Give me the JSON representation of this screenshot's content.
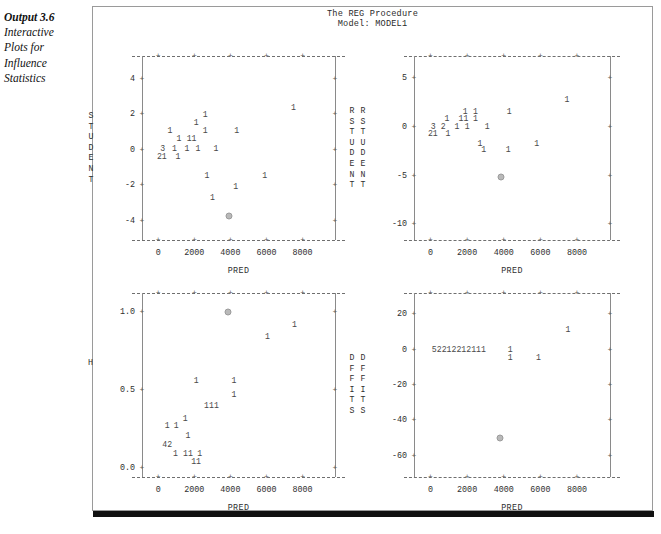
{
  "margin_caption": {
    "lead": "Output 3.6",
    "lines": [
      "Interactive",
      "Plots for",
      "Influence",
      "Statistics"
    ]
  },
  "report": {
    "title_line1": "The REG Procedure",
    "title_line2": "Model: MODEL1"
  },
  "axis": {
    "x_label": "PRED",
    "x_ticks": [
      "0",
      "2000",
      "4000",
      "6000",
      "8000"
    ],
    "x_tick_values": [
      0,
      2000,
      4000,
      6000,
      8000
    ],
    "tick_glyph": "+"
  },
  "chart_data": [
    {
      "id": "student-vs-pred",
      "type": "scatter",
      "title": "The REG Procedure",
      "subtitle": "Model: MODEL1",
      "xlabel": "PRED",
      "ylabel": "STUDENT",
      "ylabel_right": "RSTUDENT",
      "xlim": [
        -900,
        9800
      ],
      "ylim": [
        -5.1,
        5.3
      ],
      "xticks": [
        0,
        2000,
        4000,
        6000,
        8000
      ],
      "yticks": [
        4,
        2,
        0,
        -2,
        -4
      ],
      "ytick_labels": [
        "4",
        "2",
        "0",
        "-2",
        "-4"
      ],
      "grid": false,
      "legend": "none",
      "points": [
        {
          "x": 7500,
          "y": 2.35,
          "label": "1"
        },
        {
          "x": 2600,
          "y": 1.95,
          "label": "1"
        },
        {
          "x": 2100,
          "y": 1.5,
          "label": "1"
        },
        {
          "x": 650,
          "y": 1.05,
          "label": "1"
        },
        {
          "x": 2600,
          "y": 1.05,
          "label": "1"
        },
        {
          "x": 4350,
          "y": 1.05,
          "label": "1"
        },
        {
          "x": 1150,
          "y": 0.6,
          "label": "1"
        },
        {
          "x": 1850,
          "y": 0.6,
          "label": "11"
        },
        {
          "x": 250,
          "y": 0.05,
          "label": "3"
        },
        {
          "x": 900,
          "y": 0.05,
          "label": "1"
        },
        {
          "x": 1600,
          "y": 0.05,
          "label": "1"
        },
        {
          "x": 2200,
          "y": 0.05,
          "label": "1"
        },
        {
          "x": 3200,
          "y": 0.05,
          "label": "1"
        },
        {
          "x": 200,
          "y": -0.4,
          "label": "21"
        },
        {
          "x": 1100,
          "y": -0.4,
          "label": "1"
        },
        {
          "x": 2700,
          "y": -1.5,
          "label": "1"
        },
        {
          "x": 5900,
          "y": -1.5,
          "label": "1"
        },
        {
          "x": 4300,
          "y": -2.1,
          "label": "1"
        },
        {
          "x": 3000,
          "y": -2.7,
          "label": "1"
        }
      ],
      "highlight": {
        "x": 3900,
        "y": -3.75,
        "symbol": "selected-observation"
      }
    },
    {
      "id": "rstudent-vs-pred",
      "type": "scatter",
      "xlabel": "PRED",
      "ylabel": "RSTUDENT",
      "xlim": [
        -900,
        9800
      ],
      "ylim": [
        -11.6,
        7.3
      ],
      "xticks": [
        0,
        2000,
        4000,
        6000,
        8000
      ],
      "yticks": [
        5,
        0,
        -5,
        -10
      ],
      "ytick_labels": [
        "5",
        "0",
        "-5",
        "-10"
      ],
      "grid": false,
      "legend": "none",
      "points": [
        {
          "x": 7450,
          "y": 2.8,
          "label": "1"
        },
        {
          "x": 1900,
          "y": 1.5,
          "label": "1"
        },
        {
          "x": 2450,
          "y": 1.5,
          "label": "1"
        },
        {
          "x": 4300,
          "y": 1.5,
          "label": "1"
        },
        {
          "x": 900,
          "y": 0.85,
          "label": "1"
        },
        {
          "x": 1800,
          "y": 0.85,
          "label": "11"
        },
        {
          "x": 2450,
          "y": 0.85,
          "label": "1"
        },
        {
          "x": 150,
          "y": 0.05,
          "label": "3"
        },
        {
          "x": 700,
          "y": 0.05,
          "label": "2"
        },
        {
          "x": 1450,
          "y": 0.05,
          "label": "1"
        },
        {
          "x": 2000,
          "y": 0.05,
          "label": "1"
        },
        {
          "x": 3100,
          "y": 0.05,
          "label": "1"
        },
        {
          "x": 130,
          "y": -0.7,
          "label": "21"
        },
        {
          "x": 950,
          "y": -0.7,
          "label": "1"
        },
        {
          "x": 2700,
          "y": -1.7,
          "label": "1"
        },
        {
          "x": 5800,
          "y": -1.7,
          "label": "1"
        },
        {
          "x": 2900,
          "y": -2.4,
          "label": "1"
        },
        {
          "x": 4250,
          "y": -2.4,
          "label": "1"
        }
      ],
      "highlight": {
        "x": 3850,
        "y": -5.1,
        "symbol": "selected-observation"
      }
    },
    {
      "id": "h-vs-pred",
      "type": "scatter",
      "xlabel": "PRED",
      "ylabel": "H",
      "ylabel_right": "DFFITS",
      "xlim": [
        -900,
        9800
      ],
      "ylim": [
        -0.06,
        1.12
      ],
      "xticks": [
        0,
        2000,
        4000,
        6000,
        8000
      ],
      "yticks": [
        1.0,
        0.5,
        0.0
      ],
      "ytick_labels": [
        "1.0",
        "0.5",
        "0.0"
      ],
      "grid": false,
      "legend": "none",
      "points": [
        {
          "x": 7550,
          "y": 0.915,
          "label": "1"
        },
        {
          "x": 6050,
          "y": 0.835,
          "label": "1"
        },
        {
          "x": 2100,
          "y": 0.555,
          "label": "1"
        },
        {
          "x": 4200,
          "y": 0.555,
          "label": "1"
        },
        {
          "x": 4200,
          "y": 0.465,
          "label": "1"
        },
        {
          "x": 2950,
          "y": 0.395,
          "label": "111"
        },
        {
          "x": 1500,
          "y": 0.315,
          "label": "1"
        },
        {
          "x": 500,
          "y": 0.265,
          "label": "1"
        },
        {
          "x": 1000,
          "y": 0.265,
          "label": "1"
        },
        {
          "x": 1650,
          "y": 0.205,
          "label": "1"
        },
        {
          "x": 500,
          "y": 0.145,
          "label": "42"
        },
        {
          "x": 950,
          "y": 0.085,
          "label": "1"
        },
        {
          "x": 1650,
          "y": 0.085,
          "label": "11"
        },
        {
          "x": 2300,
          "y": 0.085,
          "label": "1"
        },
        {
          "x": 2100,
          "y": 0.035,
          "label": "11"
        }
      ],
      "highlight": {
        "x": 3850,
        "y": 1.0,
        "symbol": "selected-observation"
      }
    },
    {
      "id": "dffits-vs-pred",
      "type": "scatter",
      "xlabel": "PRED",
      "ylabel": "DFFITS",
      "xlim": [
        -900,
        9800
      ],
      "ylim": [
        -72,
        32
      ],
      "xticks": [
        0,
        2000,
        4000,
        6000,
        8000
      ],
      "yticks": [
        20,
        0,
        -20,
        -40,
        -60
      ],
      "ytick_labels": [
        "20",
        "0",
        "-20",
        "-40",
        "-60"
      ],
      "grid": false,
      "legend": "none",
      "points": [
        {
          "x": 7500,
          "y": 11,
          "label": "1"
        },
        {
          "x": 1550,
          "y": 0,
          "label": "52212212111"
        },
        {
          "x": 4350,
          "y": 0,
          "label": "1"
        },
        {
          "x": 4350,
          "y": -5,
          "label": "1"
        },
        {
          "x": 5900,
          "y": -5,
          "label": "1"
        }
      ],
      "highlight": {
        "x": 3800,
        "y": -50,
        "symbol": "selected-observation"
      }
    }
  ]
}
